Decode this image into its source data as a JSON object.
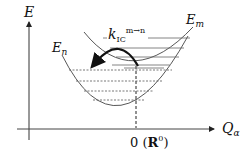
{
  "diagram": {
    "type": "potential-energy-surface",
    "axes": {
      "y_label": "E",
      "x_label_main": "Q",
      "x_label_sub": "α",
      "origin_label_zero": "0",
      "origin_label_open": "(",
      "origin_label_bold": "R",
      "origin_label_sup": "0",
      "origin_label_close": ")"
    },
    "curves": [
      {
        "name": "lower-state",
        "label_main": "E",
        "label_sub": "n",
        "vibrational_levels": 4,
        "level_style": "dashed"
      },
      {
        "name": "upper-state",
        "label_main": "E",
        "label_sub": "m",
        "vibrational_levels": 5,
        "level_style": "solid"
      }
    ],
    "transition": {
      "label_main": "k",
      "label_sub": "IC",
      "label_sup": "m→n",
      "direction": "from upper-state (m) to lower-state (n)"
    },
    "colors": {
      "line": "#333333",
      "text": "#111111",
      "arrow": "#111111"
    }
  }
}
